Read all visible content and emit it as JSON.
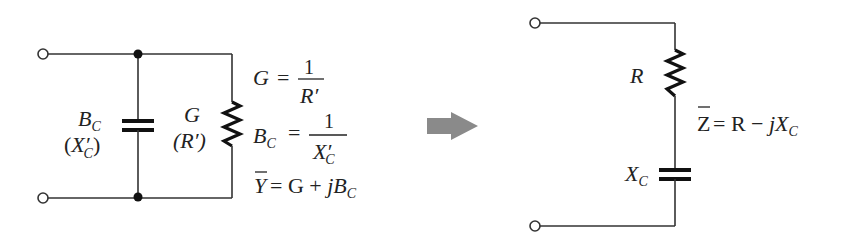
{
  "diagram": {
    "type": "circuit-equivalence",
    "parallel_circuit": {
      "capacitor_label": "B",
      "capacitor_label_sub": "C",
      "capacitor_alt_open": "(",
      "capacitor_alt": "X′",
      "capacitor_alt_sub": "C",
      "capacitor_alt_close": ")",
      "resistor_label": "G",
      "resistor_alt": "(R′)",
      "equations": {
        "g_lhs": "G",
        "g_eq": "=",
        "g_num": "1",
        "g_den": "R′",
        "bc_lhs": "B",
        "bc_lhs_sub": "C",
        "bc_eq": "=",
        "bc_num": "1",
        "bc_den": "X′",
        "bc_den_sub": "C",
        "y_lhs": "Y",
        "y_rhs_a": "= G + ",
        "y_rhs_j": "jB",
        "y_rhs_sub": "C"
      }
    },
    "arrow": {
      "direction": "right",
      "color": "#8a8a8a"
    },
    "series_circuit": {
      "resistor_label": "R",
      "capacitor_label": "X",
      "capacitor_label_sub": "C",
      "equation": {
        "z_lhs": "Z",
        "z_rhs_a": "= R − ",
        "z_rhs_j": "jX",
        "z_rhs_sub": "C"
      }
    },
    "colors": {
      "wire": "#333333",
      "component": "#111111",
      "text": "#222222",
      "arrow": "#8a8a8a"
    }
  }
}
